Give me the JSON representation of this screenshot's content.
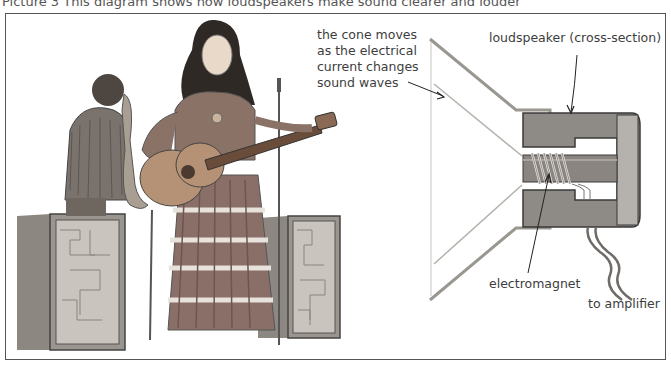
{
  "caption": "Picture 3  This diagram shows how loudspeakers make sound clearer and louder",
  "illustration": {
    "subject": "folk singer with guitar, saxophone player, two speaker cabinets, microphone stand"
  },
  "diagram": {
    "labels": {
      "cone": [
        "the cone moves",
        "as the electrical",
        "current changes",
        "sound waves"
      ],
      "loudspeaker": "loudspeaker (cross-section)",
      "electromagnet": "electromagnet",
      "amplifier": "to amplifier"
    },
    "colors": {
      "magnet": "#8e8a86",
      "magnet_light": "#b5b1ac",
      "cone_line": "#9a9690",
      "outline": "#3a3a3a"
    }
  }
}
